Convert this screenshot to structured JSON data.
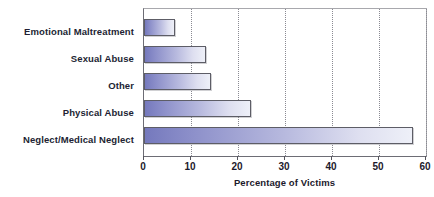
{
  "chart_data": {
    "type": "bar",
    "orientation": "horizontal",
    "title": "",
    "subtitle": "",
    "xlabel": "Percentage of Victims",
    "ylabel": "",
    "categories": [
      "Emotional Maltreatment",
      "Sexual Abuse",
      "Other",
      "Physical Abuse",
      "Neglect/Medical Neglect"
    ],
    "values": [
      6.5,
      13.2,
      14.3,
      22.8,
      57.3
    ],
    "series": [
      {
        "name": "Percentage of Victims",
        "values": [
          6.5,
          13.2,
          14.3,
          22.8,
          57.3
        ]
      }
    ],
    "xlim": [
      0,
      60
    ],
    "xticks": [
      0,
      10,
      20,
      30,
      40,
      50,
      60
    ],
    "xtick_labels": [
      "0",
      "10",
      "20",
      "30",
      "40",
      "50",
      "60"
    ],
    "grid": "vertical-dotted",
    "legend": "none",
    "bar_gradient_start": "#7579bd",
    "bar_gradient_end": "#eef0f8",
    "bar_border_color": "#5d5d66",
    "axis_color": "#6d6d75",
    "gridline_color": "#8a8a92",
    "text_color": "#1c1a2c",
    "background": "#ffffff"
  }
}
